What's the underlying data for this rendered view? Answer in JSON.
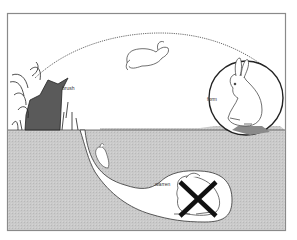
{
  "figure": {
    "labels": {
      "brush": "brush",
      "form": "form",
      "warren": "warren"
    },
    "elements": [
      {
        "name": "frame",
        "type": "rectangle-border"
      },
      {
        "name": "ground-surface-soil",
        "type": "grey-fill"
      },
      {
        "name": "leaping-rabbit",
        "type": "illustration"
      },
      {
        "name": "rabbit-in-form",
        "type": "illustration",
        "enclosed_in": "circle"
      },
      {
        "name": "brush-vegetation",
        "type": "illustration"
      },
      {
        "name": "burrow-tunnel",
        "type": "illustration"
      },
      {
        "name": "rabbit-in-tunnel",
        "type": "illustration"
      },
      {
        "name": "rabbit-in-warren",
        "type": "illustration",
        "crossed_out": true
      },
      {
        "name": "jump-trajectory",
        "type": "dotted-arc"
      }
    ],
    "colors": {
      "soil": "#c9c9c9",
      "frame": "#8a8a8a",
      "ink": "#222222",
      "background": "#ffffff"
    }
  }
}
